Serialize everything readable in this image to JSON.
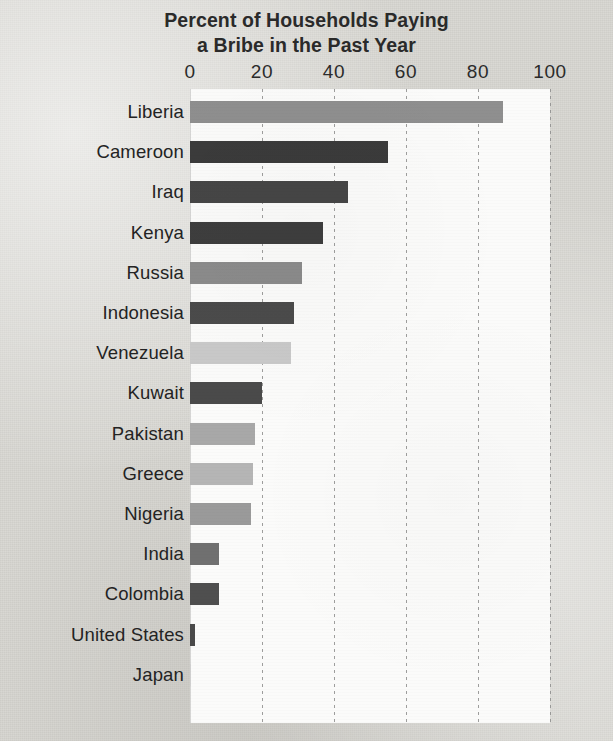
{
  "chart_data": {
    "type": "bar",
    "orientation": "horizontal",
    "title": "Percent of Households Paying a Bribe in the Past Year",
    "title_lines": [
      "Percent of Households Paying",
      "a Bribe in the Past Year"
    ],
    "xlabel": "",
    "ylabel": "",
    "xlim": [
      0,
      100
    ],
    "xticks": [
      0,
      20,
      40,
      60,
      80,
      100
    ],
    "xtick_labels": [
      "0",
      "20",
      "40",
      "60",
      "80",
      "100"
    ],
    "grid": "vertical-dashed",
    "legend": "none",
    "categories": [
      "Liberia",
      "Cameroon",
      "Iraq",
      "Kenya",
      "Russia",
      "Indonesia",
      "Venezuela",
      "Kuwait",
      "Pakistan",
      "Greece",
      "Nigeria",
      "India",
      "Colombia",
      "United States",
      "Japan"
    ],
    "values": [
      87,
      55,
      44,
      37,
      31,
      29,
      28,
      20,
      18,
      17.5,
      17,
      8,
      8,
      1.5,
      0.3
    ],
    "bar_colors": [
      "#8f8f8f",
      "#3b3b3b",
      "#464646",
      "#3e3e3e",
      "#8b8b8b",
      "#4b4b4b",
      "#c9c9c9",
      "#4a4a4a",
      "#a8a8a8",
      "#b5b5b5",
      "#9a9a9a",
      "#707070",
      "#4f4f4f",
      "#4a4a4a",
      "#d0d0d0"
    ]
  },
  "palette": {
    "page_background": "#d8d7d2",
    "plot_background": "#fbfbfa",
    "text": "#2a2a2a",
    "gridline": "#8d8d8d"
  }
}
